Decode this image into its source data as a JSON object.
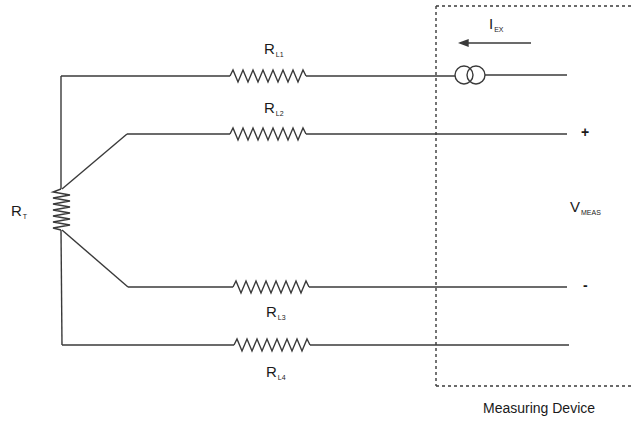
{
  "diagram": {
    "type": "4-wire RTD measurement circuit",
    "device_box_label": "Measuring Device",
    "sensor": {
      "label_main": "R",
      "label_sub": "T"
    },
    "lead_resistors": [
      {
        "id": "RL1",
        "label_main": "R",
        "label_sub": "L1"
      },
      {
        "id": "RL2",
        "label_main": "R",
        "label_sub": "L2"
      },
      {
        "id": "RL3",
        "label_main": "R",
        "label_sub": "L3"
      },
      {
        "id": "RL4",
        "label_main": "R",
        "label_sub": "L4"
      }
    ],
    "excitation": {
      "label_main": "I",
      "label_sub": "EX",
      "direction": "left",
      "symbol": "current-source"
    },
    "measurement": {
      "label_main": "V",
      "label_sub": "MEAS",
      "plus": "+",
      "minus": "-"
    }
  },
  "colors": {
    "line": "#3a3a3a",
    "background": "#ffffff"
  }
}
